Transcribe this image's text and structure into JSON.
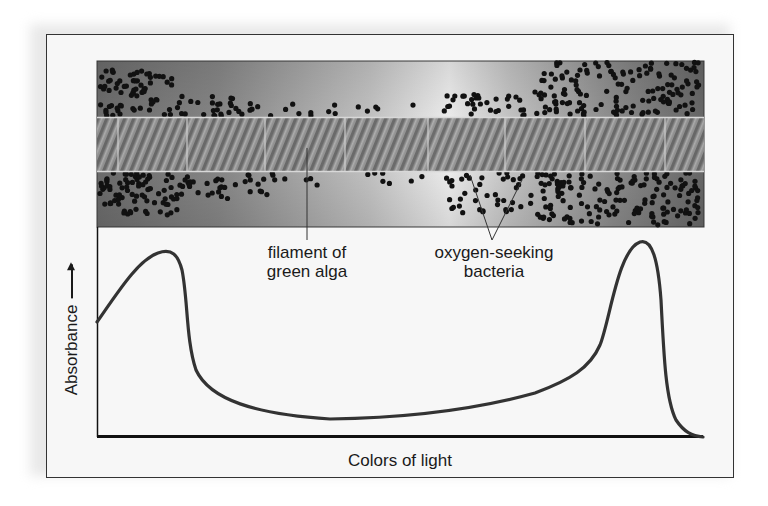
{
  "figure": {
    "labels": {
      "filament_line1": "filament of",
      "filament_line2": "green alga",
      "bacteria_line1": "oxygen-seeking",
      "bacteria_line2": "bacteria"
    },
    "axes": {
      "xlabel": "Colors of light",
      "ylabel": "Absorbance"
    },
    "colors": {
      "curve": "#333333",
      "axis": "#111111",
      "bacteria": "#111111",
      "band_dark": "#6b6b6b",
      "band_light": "#f2f2f2"
    }
  },
  "chart_data": {
    "type": "line",
    "title": "",
    "xlabel": "Colors of light",
    "ylabel": "Absorbance",
    "x_ticks": [],
    "y_ticks": [],
    "grid": false,
    "legend": null,
    "series": [
      {
        "name": "Absorption spectrum (green alga)",
        "x": [
          0,
          0.03,
          0.06,
          0.08,
          0.095,
          0.11,
          0.125,
          0.14,
          0.2,
          0.3,
          0.4,
          0.5,
          0.6,
          0.7,
          0.78,
          0.84,
          0.87,
          0.89,
          0.9,
          0.915,
          0.93,
          0.96,
          0.99,
          1.0
        ],
        "y": [
          0.59,
          0.75,
          0.87,
          0.93,
          0.94,
          0.88,
          0.55,
          0.28,
          0.12,
          0.05,
          0.04,
          0.06,
          0.09,
          0.14,
          0.21,
          0.32,
          0.55,
          0.85,
          0.98,
          1.0,
          0.85,
          0.25,
          0.04,
          0.0
        ]
      }
    ],
    "annotations": [
      "filament of green alga",
      "oxygen-seeking bacteria"
    ],
    "ylim": [
      0,
      1
    ],
    "xlim": [
      0,
      1
    ]
  }
}
